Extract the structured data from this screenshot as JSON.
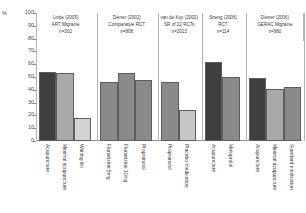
{
  "chart_data": {
    "type": "bar",
    "title": "",
    "xlabel": "",
    "ylabel": "%",
    "ylim": [
      0,
      100
    ],
    "yticks": [
      0,
      10,
      20,
      30,
      40,
      50,
      60,
      70,
      80,
      90,
      100
    ],
    "grid": false,
    "legend": "none",
    "groups": [
      {
        "study": "Linde (2005)",
        "design": "ART Migraine",
        "n": "n=302",
        "categories": [
          "Acupuncture",
          "Minimal acupuncture",
          "Waiting list"
        ],
        "values": [
          54,
          53,
          18
        ],
        "colors": [
          "#3f3f3f",
          "#a9a9a9",
          "#d3d3d3"
        ]
      },
      {
        "study": "Diener (2002)",
        "design": "Comparative RCT",
        "n": "n=808",
        "categories": [
          "Flunarizine 5mg",
          "Flunarizine 10mg",
          "Propranolol"
        ],
        "values": [
          46,
          53,
          48
        ],
        "colors": [
          "#8a8a8a",
          "#8a8a8a",
          "#8a8a8a"
        ]
      },
      {
        "study": "van de Kuy (2002)",
        "design": "SR of 22 RCTs",
        "n": "n=2013",
        "categories": [
          "Propranolol",
          "Placebo medication"
        ],
        "values": [
          46,
          24
        ],
        "colors": [
          "#8a8a8a",
          "#c6c6c6"
        ]
      },
      {
        "study": "Streng (2006)",
        "design": "RCT",
        "n": "n=114",
        "categories": [
          "Acupuncture",
          "Metoprolol"
        ],
        "values": [
          62,
          50
        ],
        "colors": [
          "#3f3f3f",
          "#8a8a8a"
        ]
      },
      {
        "study": "Diener (2006)",
        "design": "GERAC Migraine",
        "n": "n=960",
        "categories": [
          "Acupuncture",
          "Minimal acupuncture",
          "Standard medication"
        ],
        "values": [
          49,
          41,
          42
        ],
        "colors": [
          "#3f3f3f",
          "#a9a9a9",
          "#8a8a8a"
        ]
      }
    ]
  }
}
